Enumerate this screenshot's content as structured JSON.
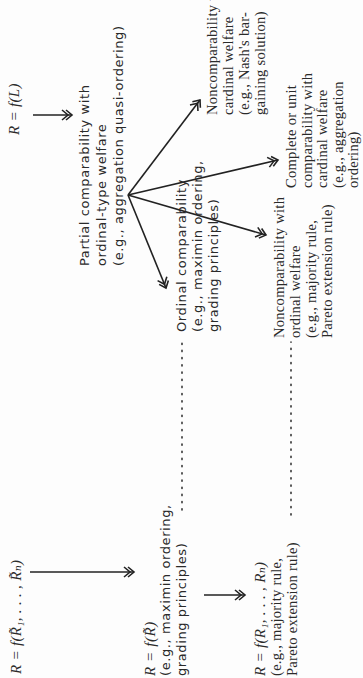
{
  "diagram": {
    "orientation": "rotated 90 degrees counter-clockwise (reads bottom-to-top)",
    "nodes": {
      "r_f_L": {
        "formula": "R = f(L)"
      },
      "partial": {
        "lines": [
          "Partial comparability with",
          "ordinal-type welfare",
          "(e.g., aggregation quasi-ordering)"
        ]
      },
      "nc_cardinal": {
        "lines": [
          "Noncomparability with",
          "cardinal welfare",
          "(e.g., Nash's bar-",
          "gaining solution)"
        ]
      },
      "ordinal": {
        "lines": [
          "Ordinal comparability",
          "(e.g., maximin ordering,",
          "grading principles)"
        ]
      },
      "nc_ordinal": {
        "lines": [
          "Noncomparability with",
          "ordinal welfare",
          "(e.g., majority rule,",
          "Pareto extension rule)"
        ]
      },
      "complete": {
        "lines": [
          "Complete or unit",
          "comparability with",
          "cardinal welfare",
          "(e.g., aggregation",
          "ordering)"
        ]
      },
      "r_f_Rtilde_list": {
        "formula": "R = f(R̃₁, . . . , R̃ₙ)"
      },
      "r_f_Rtilde": {
        "formula": "R = f(R̃)",
        "lines": [
          "(e.g., maximin ordering,",
          "grading principles)"
        ]
      },
      "r_f_R_list": {
        "formula": "R = f(R₁, . . . , Rₙ)",
        "lines": [
          "(e.g., majority rule,",
          "Pareto extension rule)"
        ]
      }
    },
    "edges": [
      {
        "from": "r_f_L",
        "to": "partial",
        "style": "arrow"
      },
      {
        "from": "partial",
        "to": "nc_cardinal",
        "style": "arrow"
      },
      {
        "from": "partial",
        "to": "ordinal",
        "style": "arrow"
      },
      {
        "from": "partial",
        "to": "nc_ordinal",
        "style": "arrow"
      },
      {
        "from": "partial",
        "to": "complete",
        "style": "arrow"
      },
      {
        "from": "r_f_Rtilde_list",
        "to": "r_f_Rtilde",
        "style": "arrow"
      },
      {
        "from": "r_f_Rtilde",
        "to": "r_f_R_list",
        "style": "arrow"
      },
      {
        "from": "r_f_Rtilde",
        "to": "ordinal",
        "style": "dotted"
      },
      {
        "from": "r_f_R_list",
        "to": "nc_ordinal",
        "style": "dotted"
      }
    ],
    "colors": {
      "ink": "#2a2a2a",
      "background": "#fdfdfd"
    }
  }
}
